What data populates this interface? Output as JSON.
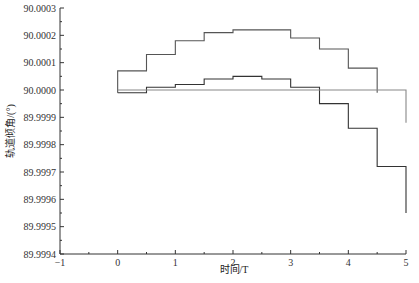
{
  "chart_data": {
    "type": "line",
    "subtype": "step",
    "title": "",
    "xlabel": "时间/T",
    "ylabel": "轨道倾角/(°)",
    "xlim": [
      -1,
      5
    ],
    "ylim": [
      89.9994,
      90.0003
    ],
    "x_ticks": [
      "-1",
      "0",
      "1",
      "2",
      "3",
      "4",
      "5"
    ],
    "y_ticks": [
      "89.9994",
      "89.9995",
      "89.9996",
      "89.9997",
      "89.9998",
      "89.9999",
      "90.0000",
      "90.0001",
      "90.0002",
      "90.0003"
    ],
    "grid": false,
    "legend": null,
    "series": [
      {
        "name": "upper",
        "color": "#555555",
        "x": [
          0,
          0.5,
          1,
          1.5,
          2,
          3,
          3.5,
          4,
          4.5
        ],
        "values": [
          90.00007,
          90.00013,
          90.00018,
          90.00021,
          90.00022,
          90.00019,
          90.00015,
          90.00008,
          89.99999
        ]
      },
      {
        "name": "lower",
        "color": "#333333",
        "x": [
          0,
          0.5,
          1,
          1.5,
          2,
          2.5,
          3,
          3.5,
          4,
          4.5,
          5
        ],
        "values": [
          89.99999,
          90.00001,
          90.00002,
          90.00004,
          90.00005,
          90.00004,
          90.00001,
          89.99995,
          89.99986,
          89.99972,
          89.99955
        ]
      },
      {
        "name": "reference",
        "color": "#888888",
        "x": [
          0,
          5
        ],
        "values": [
          90.0,
          89.99988
        ]
      }
    ]
  }
}
